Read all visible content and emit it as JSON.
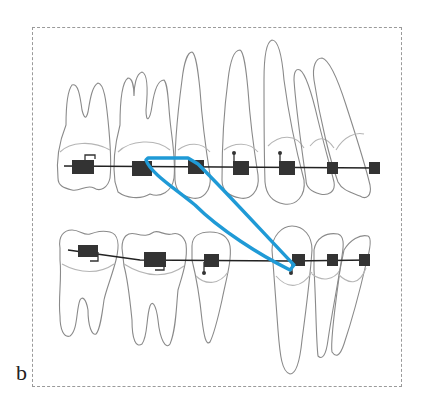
{
  "figure": {
    "panel_label": "b",
    "colors": {
      "tooth_outline": "#8a8a8a",
      "gingival_line": "#b5b5b5",
      "bracket": "#333333",
      "archwire": "#222222",
      "elastic": "#1f9ad6",
      "frame": "#9a9a9a"
    },
    "upper_arch": {
      "teeth_count": 7,
      "brackets_count": 7
    },
    "lower_arch": {
      "teeth_count": 6,
      "brackets_count": 6
    }
  }
}
